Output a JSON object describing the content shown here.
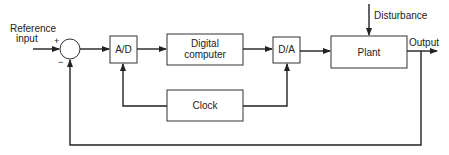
{
  "diagram": {
    "type": "block-diagram",
    "blocks": [
      {
        "id": "ad",
        "label": "A/D"
      },
      {
        "id": "computer",
        "label_line1": "Digital",
        "label_line2": "computer"
      },
      {
        "id": "da",
        "label": "D/A"
      },
      {
        "id": "plant",
        "label": "Plant"
      },
      {
        "id": "clock",
        "label": "Clock"
      }
    ],
    "summing_junction": {
      "plus": "+",
      "minus": "−"
    },
    "labels": {
      "reference_line1": "Reference",
      "reference_line2": "input",
      "disturbance": "Disturbance",
      "output": "Output"
    },
    "connections": [
      "reference -> summing_junction(+)",
      "summing_junction -> A/D",
      "A/D -> Digital computer",
      "Digital computer -> D/A",
      "D/A -> Plant",
      "Disturbance -> Plant",
      "Plant -> Output",
      "Output -> summing_junction(-) (feedback)",
      "Clock -> A/D",
      "Clock -> D/A"
    ]
  }
}
